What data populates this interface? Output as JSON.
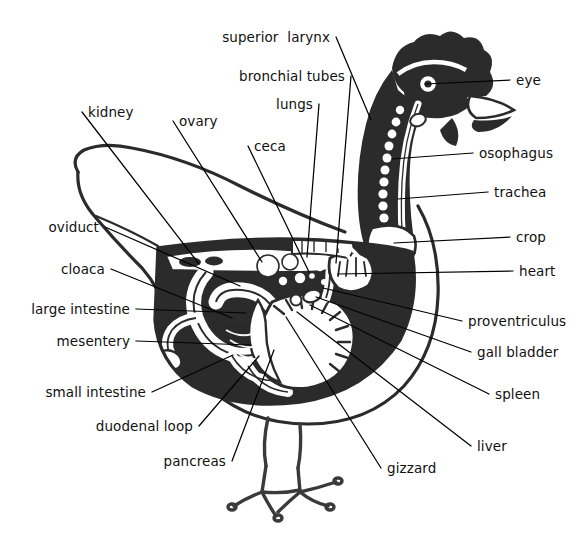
{
  "diagram": {
    "style": "black-and-white woodcut / engraving illustration",
    "background_color": "#ffffff",
    "ink_color": "#1a1a1a",
    "leader_line_color": "#000000",
    "label_count": 22
  },
  "labels": [
    {
      "id": "superior-larynx",
      "text": "superior  larynx",
      "side": "left",
      "x": 330,
      "y": 41,
      "anchor_x": 371,
      "anchor_y": 120
    },
    {
      "id": "bronchial-tubes",
      "text": "bronchial tubes",
      "side": "left",
      "x": 345,
      "y": 80,
      "anchor_x": 336,
      "anchor_y": 263
    },
    {
      "id": "lungs",
      "text": "lungs",
      "side": "left",
      "x": 313,
      "y": 108,
      "anchor_x": 307,
      "anchor_y": 257
    },
    {
      "id": "eye",
      "text": "eye",
      "side": "right",
      "x": 516,
      "y": 84,
      "anchor_x": 425,
      "anchor_y": 84
    },
    {
      "id": "osophagus",
      "text": "osophagus",
      "side": "right",
      "x": 479,
      "y": 157,
      "anchor_x": 392,
      "anchor_y": 159
    },
    {
      "id": "trachea",
      "text": "trachea",
      "side": "right",
      "x": 494,
      "y": 196,
      "anchor_x": 398,
      "anchor_y": 199
    },
    {
      "id": "crop",
      "text": "crop",
      "side": "right",
      "x": 516,
      "y": 241,
      "anchor_x": 394,
      "anchor_y": 243
    },
    {
      "id": "heart",
      "text": "heart",
      "side": "right",
      "x": 519,
      "y": 275,
      "anchor_x": 338,
      "anchor_y": 274
    },
    {
      "id": "proventriculus",
      "text": "proventriculus",
      "side": "right",
      "x": 468,
      "y": 325,
      "anchor_x": 323,
      "anchor_y": 288
    },
    {
      "id": "gall-bladder",
      "text": "gall bladder",
      "side": "right",
      "x": 477,
      "y": 356,
      "anchor_x": 316,
      "anchor_y": 297
    },
    {
      "id": "spleen",
      "text": "spleen",
      "side": "right",
      "x": 495,
      "y": 398,
      "anchor_x": 310,
      "anchor_y": 305
    },
    {
      "id": "liver",
      "text": "liver",
      "side": "right",
      "x": 477,
      "y": 450,
      "anchor_x": 297,
      "anchor_y": 312
    },
    {
      "id": "gizzard",
      "text": "gizzard",
      "side": "right",
      "x": 387,
      "y": 472,
      "anchor_x": 286,
      "anchor_y": 317
    },
    {
      "id": "kidney",
      "text": "kidney",
      "side": "right",
      "x": 88,
      "y": 116,
      "anchor_x": 199,
      "anchor_y": 264
    },
    {
      "id": "ovary",
      "text": "ovary",
      "side": "right",
      "x": 179,
      "y": 125,
      "anchor_x": 262,
      "anchor_y": 262
    },
    {
      "id": "ceca",
      "text": "ceca",
      "side": "right",
      "x": 254,
      "y": 150,
      "anchor_x": 309,
      "anchor_y": 272
    },
    {
      "id": "oviduct",
      "text": "oviduct",
      "side": "left",
      "x": 99,
      "y": 231,
      "anchor_x": 240,
      "anchor_y": 286
    },
    {
      "id": "cloaca",
      "text": "cloaca",
      "side": "left",
      "x": 105,
      "y": 273,
      "anchor_x": 232,
      "anchor_y": 318
    },
    {
      "id": "large-intestine",
      "text": "large intestine",
      "side": "left",
      "x": 130,
      "y": 313,
      "anchor_x": 246,
      "anchor_y": 313
    },
    {
      "id": "mesentery",
      "text": "mesentery",
      "side": "left",
      "x": 130,
      "y": 345,
      "anchor_x": 250,
      "anchor_y": 345
    },
    {
      "id": "small-intestine",
      "text": "small intestine",
      "side": "left",
      "x": 146,
      "y": 396,
      "anchor_x": 233,
      "anchor_y": 355
    },
    {
      "id": "duodenal-loop",
      "text": "duodenal loop",
      "side": "left",
      "x": 193,
      "y": 430,
      "anchor_x": 259,
      "anchor_y": 356
    },
    {
      "id": "pancreas",
      "text": "pancreas",
      "side": "left",
      "x": 226,
      "y": 465,
      "anchor_x": 274,
      "anchor_y": 350
    }
  ],
  "anatomy_parts": [
    "superior  larynx",
    "bronchial tubes",
    "lungs",
    "eye",
    "osophagus",
    "trachea",
    "crop",
    "heart",
    "proventriculus",
    "gall bladder",
    "spleen",
    "liver",
    "gizzard",
    "kidney",
    "ovary",
    "ceca",
    "oviduct",
    "cloaca",
    "large intestine",
    "mesentery",
    "small intestine",
    "duodenal loop",
    "pancreas"
  ]
}
